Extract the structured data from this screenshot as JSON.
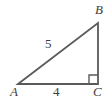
{
  "figure": {
    "kind": "right-triangle-diagram",
    "background_color": "#ffffff",
    "stroke_color": "#5a5a5a",
    "text_color": "#3d3d3d",
    "vertices": [
      {
        "name": "A",
        "label": "A",
        "x": 18,
        "y": 84,
        "angle_type": "acute"
      },
      {
        "name": "B",
        "label": "B",
        "x": 98,
        "y": 23,
        "angle_type": "acute"
      },
      {
        "name": "C",
        "label": "C",
        "x": 98,
        "y": 84,
        "angle_type": "right"
      }
    ],
    "sides": [
      {
        "name": "hypotenuse-AB",
        "from": "A",
        "to": "B",
        "label": "5"
      },
      {
        "name": "base-AC",
        "from": "A",
        "to": "C",
        "label": "4"
      },
      {
        "name": "vertical-BC",
        "from": "B",
        "to": "C",
        "label": ""
      }
    ],
    "right_angle_marker": {
      "at_vertex": "C",
      "size": 9,
      "visible": true
    }
  },
  "labels": {
    "vertex_a": "A",
    "vertex_b": "B",
    "vertex_c": "C",
    "side_hypotenuse": "5",
    "side_base": "4"
  }
}
